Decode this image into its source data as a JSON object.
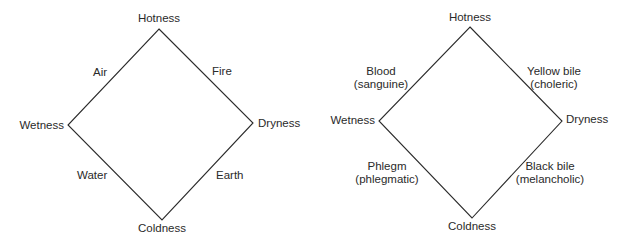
{
  "diagrams": [
    {
      "name": "elements",
      "vertices": {
        "top": "Hotness",
        "left": "Wetness",
        "right": "Dryness",
        "bottom": "Coldness"
      },
      "edges": {
        "top_left": "Air",
        "top_right": "Fire",
        "bottom_left": "Water",
        "bottom_right": "Earth"
      }
    },
    {
      "name": "humours",
      "vertices": {
        "top": "Hotness",
        "left": "Wetness",
        "right": "Dryness",
        "bottom": "Coldness"
      },
      "edges": {
        "top_left": {
          "line1": "Blood",
          "line2": "(sanguine)"
        },
        "top_right": {
          "line1": "Yellow bile",
          "line2": "(choleric)"
        },
        "bottom_left": {
          "line1": "Phlegm",
          "line2": "(phlegmatic)"
        },
        "bottom_right": {
          "line1": "Black bile",
          "line2": "(melancholic)"
        }
      }
    }
  ],
  "colors": {
    "line": "#2a2a2a",
    "background": "#ffffff"
  }
}
